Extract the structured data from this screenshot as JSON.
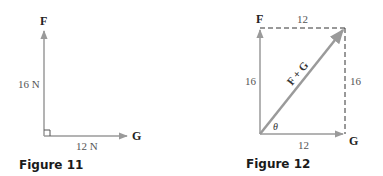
{
  "colors": {
    "vector": "#9a9a9a",
    "text": "#222222",
    "label": "#555555",
    "caption": "#1a1a1a"
  },
  "figure11": {
    "caption": "Figure 11",
    "vector_f": {
      "name": "F",
      "magnitude_label": "16 N"
    },
    "vector_g": {
      "name": "G",
      "magnitude_label": "12 N"
    },
    "right_angle": true
  },
  "figure12": {
    "caption": "Figure 12",
    "vector_f": {
      "name": "F",
      "magnitude_label": "16"
    },
    "vector_g": {
      "name": "G",
      "magnitude_label": "12"
    },
    "top_side_label": "12",
    "right_side_label": "16",
    "resultant_label": "F + G",
    "angle_label": "θ"
  }
}
